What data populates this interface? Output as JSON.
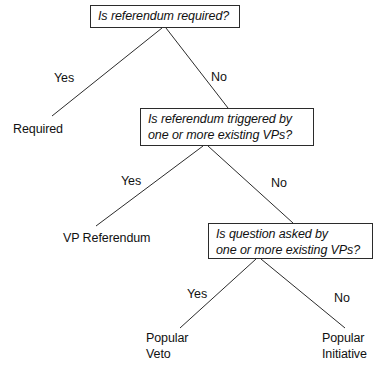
{
  "diagram": {
    "type": "decision-tree",
    "background_color": "#ffffff",
    "line_color": "#2b2b2b",
    "text_color": "#111111",
    "decision_nodes": [
      {
        "id": "q1",
        "text": "Is referendum required?",
        "x": 90,
        "y": 5,
        "w": 150,
        "h": 23
      },
      {
        "id": "q2",
        "text": "Is referendum triggered by\none or more existing VPs?",
        "x": 140,
        "y": 108,
        "w": 174,
        "h": 38
      },
      {
        "id": "q3",
        "text": "Is question asked by\none or more existing VPs?",
        "x": 208,
        "y": 223,
        "w": 165,
        "h": 36
      }
    ],
    "outcome_nodes": [
      {
        "id": "required",
        "text": "Required",
        "x": 13,
        "y": 122
      },
      {
        "id": "vp-referendum",
        "text": "VP Referendum",
        "x": 63,
        "y": 231
      },
      {
        "id": "popular-veto",
        "text": "Popular\nVeto",
        "x": 146,
        "y": 331
      },
      {
        "id": "popular-initiative",
        "text": "Popular\nInitiative",
        "x": 322,
        "y": 331
      }
    ],
    "edges": [
      {
        "id": "q1-yes",
        "from": "q1",
        "to": "required",
        "label": "Yes",
        "x1": 162,
        "y1": 28,
        "x2": 52,
        "y2": 116,
        "label_x": 54,
        "label_y": 71
      },
      {
        "id": "q1-no",
        "from": "q1",
        "to": "q2",
        "label": "No",
        "x1": 166,
        "y1": 28,
        "x2": 228,
        "y2": 108,
        "label_x": 211,
        "label_y": 70
      },
      {
        "id": "q2-yes",
        "from": "q2",
        "to": "vp-referendum",
        "label": "Yes",
        "x1": 203,
        "y1": 146,
        "x2": 96,
        "y2": 226,
        "label_x": 121,
        "label_y": 174
      },
      {
        "id": "q2-no",
        "from": "q2",
        "to": "q3",
        "label": "No",
        "x1": 208,
        "y1": 146,
        "x2": 293,
        "y2": 223,
        "label_x": 271,
        "label_y": 176
      },
      {
        "id": "q3-yes",
        "from": "q3",
        "to": "popular-veto",
        "label": "Yes",
        "x1": 256,
        "y1": 259,
        "x2": 180,
        "y2": 328,
        "label_x": 187,
        "label_y": 287
      },
      {
        "id": "q3-no",
        "from": "q3",
        "to": "popular-initiative",
        "label": "No",
        "x1": 261,
        "y1": 259,
        "x2": 345,
        "y2": 328,
        "label_x": 334,
        "label_y": 291
      }
    ]
  }
}
